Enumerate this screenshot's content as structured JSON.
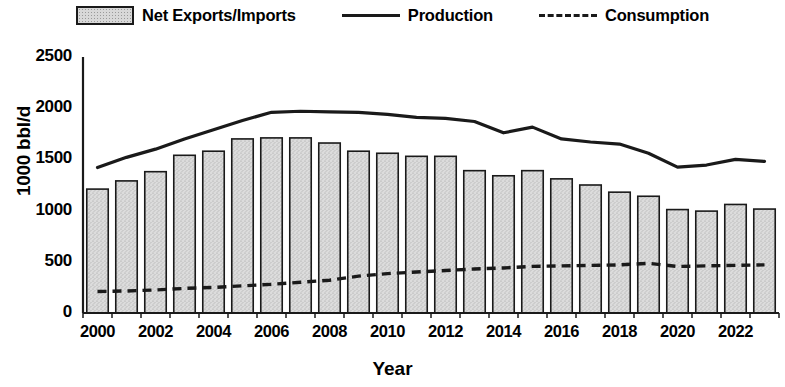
{
  "legend": {
    "items": [
      {
        "label": "Net Exports/Imports",
        "marker": "bar-swatch"
      },
      {
        "label": "Production",
        "marker": "solid-line-swatch"
      },
      {
        "label": "Consumption",
        "marker": "dashed-line-swatch"
      }
    ]
  },
  "axes": {
    "ylabel": "1000 bbl/d",
    "xlabel": "Year",
    "yticks": [
      "0",
      "500",
      "1000",
      "1500",
      "2000",
      "2500"
    ],
    "xticks": [
      "2000",
      "2002",
      "2004",
      "2006",
      "2008",
      "2010",
      "2012",
      "2014",
      "2016",
      "2018",
      "2020",
      "2022"
    ]
  },
  "colors": {
    "bar_fill": "#d8d8d8",
    "bar_edge": "#1a1a1a",
    "line": "#1a1a1a",
    "axis": "#1a1a1a",
    "text": "#000000"
  },
  "chart_data": {
    "type": "bar",
    "title": "",
    "xlabel": "Year",
    "ylabel": "1000 bbl/d",
    "ylim": [
      0,
      2500
    ],
    "ytick_step": 500,
    "grid": false,
    "legend_position": "top-center",
    "categories": [
      "2000",
      "2001",
      "2002",
      "2003",
      "2004",
      "2005",
      "2006",
      "2007",
      "2008",
      "2009",
      "2010",
      "2011",
      "2012",
      "2013",
      "2014",
      "2015",
      "2016",
      "2017",
      "2018",
      "2019",
      "2020",
      "2021",
      "2022",
      "2023"
    ],
    "series": [
      {
        "name": "Net Exports/Imports",
        "type": "bar",
        "values": [
          1210,
          1290,
          1380,
          1540,
          1580,
          1700,
          1710,
          1710,
          1660,
          1580,
          1560,
          1530,
          1530,
          1390,
          1340,
          1390,
          1310,
          1250,
          1180,
          1140,
          1010,
          995,
          1060,
          1015
        ]
      },
      {
        "name": "Production",
        "type": "line",
        "style": "solid",
        "values": [
          1420,
          1520,
          1600,
          1700,
          1790,
          1880,
          1960,
          1970,
          1965,
          1960,
          1940,
          1910,
          1900,
          1870,
          1760,
          1815,
          1700,
          1670,
          1650,
          1560,
          1425,
          1445,
          1500,
          1480
        ]
      },
      {
        "name": "Consumption",
        "type": "line",
        "style": "dashed",
        "values": [
          210,
          215,
          225,
          240,
          250,
          265,
          280,
          300,
          320,
          360,
          385,
          400,
          415,
          430,
          440,
          455,
          460,
          465,
          470,
          485,
          455,
          460,
          465,
          470
        ]
      }
    ]
  }
}
